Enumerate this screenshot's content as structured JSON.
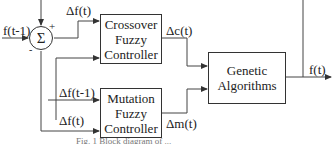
{
  "diagram": {
    "sum_node": {
      "symbol": "Σ",
      "plus_sign": "+",
      "minus_sign": "-"
    },
    "inputs": {
      "prev_fitness": "f(t-1)"
    },
    "blocks": {
      "crossover": {
        "lines": [
          "Crossover",
          "Fuzzy",
          "Controller"
        ]
      },
      "mutation": {
        "lines": [
          "Mutation",
          "Fuzzy",
          "Controller"
        ]
      },
      "genetic": {
        "lines": [
          "Genetic",
          "Algorithms"
        ]
      }
    },
    "signals": {
      "delta_f_top": "Δf(t)",
      "delta_f_prev": "Δf(t-1)",
      "delta_f_bottom": "Δf(t)",
      "delta_c": "Δc(t)",
      "delta_m": "Δm(t)",
      "output": "f(t)"
    },
    "caption": "Fig. 1 Block diagram of ..."
  }
}
